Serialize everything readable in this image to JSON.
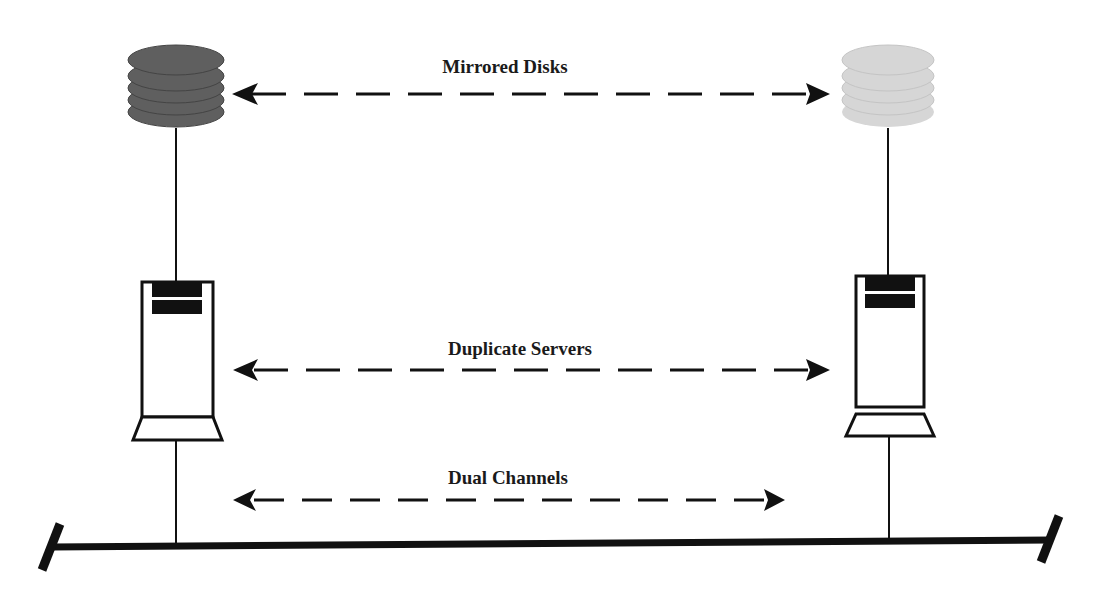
{
  "diagram": {
    "labels": {
      "mirrored_disks": "Mirrored Disks",
      "duplicate_servers": "Duplicate Servers",
      "dual_channels": "Dual Channels"
    },
    "nodes": [
      {
        "id": "disk-left",
        "type": "disk-stack",
        "color": "#5f5f5f",
        "x": 176,
        "y": 80
      },
      {
        "id": "disk-right",
        "type": "disk-stack",
        "color": "#d6d6d6",
        "x": 888,
        "y": 80
      },
      {
        "id": "server-left",
        "type": "server-tower",
        "x": 176,
        "y": 375
      },
      {
        "id": "server-right",
        "type": "server-tower",
        "x": 889,
        "y": 365
      }
    ],
    "connections": [
      {
        "from": "disk-left",
        "to": "disk-right",
        "style": "dashed-bidirectional",
        "label_key": "mirrored_disks"
      },
      {
        "from": "server-left",
        "to": "server-right",
        "style": "dashed-bidirectional",
        "label_key": "duplicate_servers"
      },
      {
        "from": "bus-left",
        "to": "bus-right",
        "style": "dashed-bidirectional",
        "label_key": "dual_channels"
      }
    ],
    "colors": {
      "line": "#111111",
      "disk_dark": "#5f5f5f",
      "disk_light": "#d6d6d6"
    }
  }
}
